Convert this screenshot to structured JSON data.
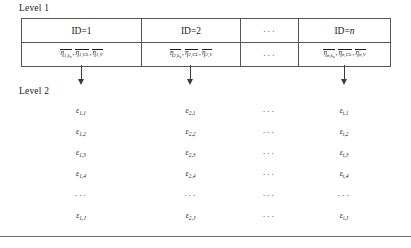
{
  "figure": {
    "level1_label": "Level 1",
    "level2_label": "Level 2",
    "ellipsis": "···",
    "overbar_symbol": "η",
    "epsilon_symbol": "ε"
  },
  "level1": {
    "headers": [
      {
        "prefix": "ID=",
        "index": "1",
        "index_italic": false
      },
      {
        "prefix": "ID=",
        "index": "2",
        "index_italic": false
      },
      {
        "prefix": "",
        "index": "···",
        "index_italic": false
      },
      {
        "prefix": "ID=",
        "index": "n",
        "index_italic": true
      }
    ],
    "params": [
      {
        "is_ellipsis": false,
        "subject": "1",
        "terms": [
          {
            "sub": "1,",
            "subsub": "k",
            "subsubsub": "a"
          },
          {
            "sub": "1,CL"
          },
          {
            "sub": "1,V"
          }
        ]
      },
      {
        "is_ellipsis": false,
        "subject": "2",
        "terms": [
          {
            "sub": "2,",
            "subsub": "k",
            "subsubsub": "a"
          },
          {
            "sub": "2,CL"
          },
          {
            "sub": "2,V"
          }
        ]
      },
      {
        "is_ellipsis": true,
        "ellipsis": "···"
      },
      {
        "is_ellipsis": false,
        "subject": "n",
        "terms": [
          {
            "sub": "n,",
            "subsub": "k",
            "subsubsub": "a"
          },
          {
            "sub": "n,CL"
          },
          {
            "sub": "n,V"
          }
        ]
      }
    ]
  },
  "arrows": [
    {
      "from_column": 1,
      "to_level": 2
    },
    {
      "from_column": 2,
      "to_level": 2
    },
    {
      "from_column": 4,
      "to_level": 2
    }
  ],
  "level2": {
    "column_indices": [
      "1",
      "2",
      "···",
      "i"
    ],
    "row_indices": [
      "1",
      "2",
      "3",
      "4",
      "···",
      "J"
    ],
    "cells": [
      [
        {
          "sub": "1,1"
        },
        {
          "sub": "2,1"
        },
        {
          "is_ellipsis": true,
          "text": "···"
        },
        {
          "sub": "i,1"
        }
      ],
      [
        {
          "sub": "1,2"
        },
        {
          "sub": "2,2"
        },
        {
          "is_ellipsis": true,
          "text": "···"
        },
        {
          "sub": "i,2"
        }
      ],
      [
        {
          "sub": "1,3"
        },
        {
          "sub": "2,3"
        },
        {
          "is_ellipsis": true,
          "text": "···"
        },
        {
          "sub": "i,3"
        }
      ],
      [
        {
          "sub": "1,4"
        },
        {
          "sub": "2,4"
        },
        {
          "is_ellipsis": true,
          "text": "···"
        },
        {
          "sub": "i,4"
        }
      ],
      [
        {
          "is_ellipsis": true,
          "text": "···"
        },
        {
          "is_ellipsis": true,
          "text": "···"
        },
        {
          "is_ellipsis": true,
          "text": "···"
        },
        {
          "is_ellipsis": true,
          "text": "···"
        }
      ],
      [
        {
          "sub": "1,J"
        },
        {
          "sub": "2,J"
        },
        {
          "is_ellipsis": true,
          "text": "···"
        },
        {
          "sub": "i,J"
        }
      ]
    ]
  },
  "colors": {
    "border": "#555555",
    "text": "#1a1a1a",
    "rule": "#6b6b6b",
    "background": "#ffffff"
  }
}
